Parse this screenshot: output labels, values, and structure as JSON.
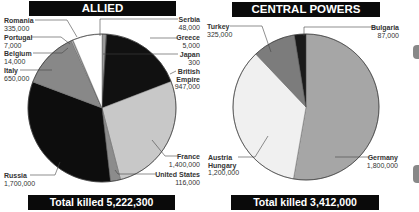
{
  "chart_data": [
    {
      "type": "pie",
      "title": "ALLIED",
      "footer": "Total killed 5,222,300",
      "categories": [
        "Serbia",
        "Greece",
        "Japan",
        "British Empire",
        "France",
        "United States",
        "Russia",
        "Italy",
        "Belgium",
        "Portugal",
        "Romania"
      ],
      "values": [
        48000,
        5000,
        300,
        947000,
        1400000,
        116000,
        1700000,
        650000,
        14000,
        7000,
        335000
      ],
      "value_labels": [
        "48,000",
        "5,000",
        "300",
        "947,000",
        "1,400,000",
        "116,000",
        "1,700,000",
        "650,000",
        "14,000",
        "7,000",
        "335,000"
      ],
      "colors": [
        "#9a9a9a",
        "#6e6e6e",
        "#2a2a2a",
        "#111111",
        "#c8c8c8",
        "#8c8c8c",
        "#0d0d0d",
        "#888888",
        "#cfcfcf",
        "#b0b0b0",
        "#ffffff"
      ]
    },
    {
      "type": "pie",
      "title": "CENTRAL POWERS",
      "footer": "Total killed 3,412,000",
      "categories": [
        "Germany",
        "Austria Hungary",
        "Turkey",
        "Bulgaria"
      ],
      "values": [
        1800000,
        1200000,
        325000,
        87000
      ],
      "value_labels": [
        "1,800,000",
        "1,200,000",
        "325,000",
        "87,000"
      ],
      "colors": [
        "#a6a6a6",
        "#f0f0f0",
        "#7c7c7c",
        "#1a1a1a"
      ]
    }
  ],
  "allied": {
    "title": "ALLIED",
    "total": "Total killed 5,222,300",
    "labels": {
      "romania": {
        "name": "Romania",
        "value": "335,000"
      },
      "portugal": {
        "name": "Portugal",
        "value": "7,000"
      },
      "belgium": {
        "name": "Belgium",
        "value": "14,000"
      },
      "italy": {
        "name": "Italy",
        "value": "650,000"
      },
      "russia": {
        "name": "Russia",
        "value": "1,700,000"
      },
      "serbia": {
        "name": "Serbia",
        "value": "48,000"
      },
      "greece": {
        "name": "Greece",
        "value": "5,000"
      },
      "japan": {
        "name": "Japan",
        "value": "300"
      },
      "british1": {
        "name": "British",
        "value": ""
      },
      "british2": {
        "name": "Empire",
        "value": "947,000"
      },
      "france": {
        "name": "France",
        "value": "1,400,000"
      },
      "usa": {
        "name": "United States",
        "value": "116,000"
      }
    }
  },
  "central": {
    "title": "CENTRAL POWERS",
    "total": "Total killed 3,412,000",
    "labels": {
      "turkey": {
        "name": "Turkey",
        "value": "325,000"
      },
      "bulgaria": {
        "name": "Bulgaria",
        "value": "87,000"
      },
      "austria1": {
        "name": "Austria",
        "value": ""
      },
      "austria2": {
        "name": "Hungary",
        "value": "1,200,000"
      },
      "germany": {
        "name": "Germany",
        "value": "1,800,000"
      }
    }
  }
}
